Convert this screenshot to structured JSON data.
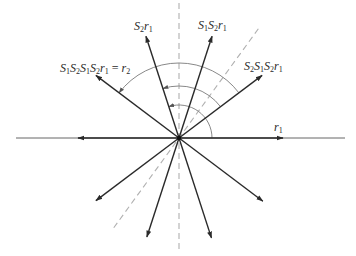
{
  "diagram": {
    "title": "",
    "center": {
      "x": 179,
      "y": 138
    },
    "colors": {
      "vector": "#2a2a2a",
      "axis_line": "#555555",
      "dashed": "#b0b0b0",
      "arc": "#7a7a7a",
      "background": "#ffffff"
    },
    "labels": {
      "r1": {
        "text": "r₁",
        "parts": [
          [
            "r",
            "1"
          ]
        ]
      },
      "S2S1S2r1": {
        "text": "S₂S₁S₂r₁",
        "parts": [
          [
            "S",
            "2"
          ],
          [
            "S",
            "1"
          ],
          [
            "S",
            "2"
          ],
          [
            "r",
            "1"
          ]
        ]
      },
      "S1S2r1": {
        "text": "S₁S₂r₁",
        "parts": [
          [
            "S",
            "1"
          ],
          [
            "S",
            "2"
          ],
          [
            "r",
            "1"
          ]
        ]
      },
      "S2r1": {
        "text": "S₂r₁",
        "parts": [
          [
            "S",
            "2"
          ],
          [
            "r",
            "1"
          ]
        ]
      },
      "r2": {
        "text": "S₁S₂S₁S₂r₁ = r₂",
        "parts": [
          [
            "S",
            "1"
          ],
          [
            "S",
            "2"
          ],
          [
            "S",
            "1"
          ],
          [
            "S",
            "2"
          ],
          [
            "r",
            "1"
          ]
        ],
        "suffix": " = ",
        "suffix_parts": [
          [
            "r",
            "2"
          ]
        ]
      }
    },
    "vectors": [
      {
        "name": "r1",
        "angle_deg": 0,
        "length": 104,
        "labeled": true
      },
      {
        "name": "S2S1S2r1",
        "angle_deg": 37,
        "length": 104,
        "labeled": true
      },
      {
        "name": "S1S2r1",
        "angle_deg": 72,
        "length": 107,
        "labeled": true
      },
      {
        "name": "S2r1",
        "angle_deg": 108,
        "length": 107,
        "labeled": true
      },
      {
        "name": "r2",
        "angle_deg": 143,
        "length": 104,
        "labeled": true
      },
      {
        "name": "neg-r1",
        "angle_deg": 180,
        "length": 101,
        "labeled": false
      },
      {
        "name": "lower-left-1",
        "angle_deg": 217,
        "length": 104,
        "labeled": false
      },
      {
        "name": "lower-left-2",
        "angle_deg": 252,
        "length": 104,
        "labeled": false
      },
      {
        "name": "lower-right-2",
        "angle_deg": 288,
        "length": 105,
        "labeled": false
      },
      {
        "name": "lower-right-1",
        "angle_deg": 323,
        "length": 105,
        "labeled": false
      }
    ],
    "reflection_lines": [
      {
        "name": "mirror-vertical",
        "angle_deg": 90,
        "style": "dashed"
      },
      {
        "name": "mirror-diagonal",
        "angle_deg": 54,
        "style": "dashed"
      }
    ],
    "arcs": [
      {
        "name": "arc-inner",
        "radius": 33,
        "from_deg": 0,
        "to_deg": 108
      },
      {
        "name": "arc-middle",
        "radius": 52,
        "from_deg": 37,
        "to_deg": 108
      },
      {
        "name": "arc-outer",
        "radius": 75,
        "from_deg": 37,
        "to_deg": 143
      }
    ],
    "axis": {
      "left_x": 16,
      "right_x": 345
    }
  }
}
